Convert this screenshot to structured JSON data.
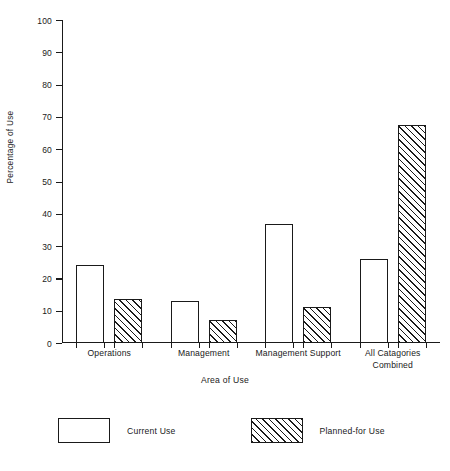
{
  "chart_data": {
    "type": "bar",
    "title": "",
    "xlabel": "Area of Use",
    "ylabel": "Percentage of Use",
    "categories": [
      "Operations",
      "Management",
      "Management Support",
      "All Catagories\nCombined"
    ],
    "series": [
      {
        "name": "Current Use",
        "style": "outline",
        "values": [
          24,
          13,
          37,
          26
        ]
      },
      {
        "name": "Planned-for Use",
        "style": "hatched",
        "values": [
          13.7,
          7,
          11,
          67.5
        ]
      }
    ],
    "ylim": [
      0,
      100
    ],
    "ytick_step": 10,
    "ytick_labels": [
      "100",
      "90",
      "80",
      "70",
      "60",
      "50",
      "40",
      "30",
      "20",
      "10",
      "0"
    ],
    "grid": false,
    "legend_position": "bottom",
    "colors": {
      "ink": "#1a1a1a",
      "fill": "#ffffff"
    }
  },
  "legend": {
    "entries": [
      {
        "label": "Current Use",
        "swatch": "outline-swatch"
      },
      {
        "label": "Planned-for Use",
        "swatch": "hatched-swatch"
      }
    ]
  }
}
